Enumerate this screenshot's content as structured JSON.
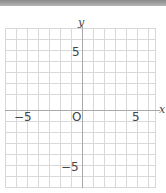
{
  "header_bar": {
    "color": "#999999"
  },
  "axes": {
    "x_label": "x",
    "y_label": "y",
    "origin_label": "O",
    "ticks": {
      "x_neg": "−5",
      "x_pos": "5",
      "y_pos": "5",
      "y_neg": "−5"
    }
  },
  "grid": {
    "x_min": -7,
    "x_max": 7,
    "y_min": -7,
    "y_max": 7,
    "step": 1,
    "line_color": "#d6d6d6",
    "axis_color": "#aaaaaa"
  }
}
